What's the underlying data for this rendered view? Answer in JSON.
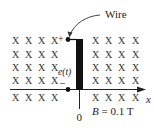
{
  "diagram": {
    "type": "physics-circuit-in-magnetic-field",
    "field_symbol": "X",
    "field_direction": "into page",
    "callout_label": "Wire",
    "emf_label": "e(t)",
    "plus_label": "+",
    "minus_label": "–",
    "origin_label": "0",
    "axis_label": "x",
    "field_label_var": "B",
    "field_label_eq": " = 0.1 T",
    "grid_rows": [
      {
        "y": 44,
        "left_x": [
          12,
          25,
          38,
          51
        ],
        "right_x": [
          92,
          105,
          118,
          132
        ]
      },
      {
        "y": 58,
        "left_x": [
          12,
          25,
          38,
          51
        ],
        "right_x": [
          92,
          105,
          118,
          132
        ]
      },
      {
        "y": 71,
        "left_x": [
          12,
          25,
          38,
          51
        ],
        "right_x": [
          92,
          105,
          118,
          132
        ]
      },
      {
        "y": 84,
        "left_x": [
          12,
          25,
          38,
          51
        ],
        "right_x": [
          92,
          105,
          118,
          132
        ]
      },
      {
        "y": 101,
        "left_x": [
          12,
          25,
          38,
          51
        ],
        "right_x": [
          92,
          105,
          118,
          132
        ]
      }
    ],
    "colors": {
      "ink": "#111111",
      "marks": "#333333",
      "background": "#ffffff"
    }
  }
}
